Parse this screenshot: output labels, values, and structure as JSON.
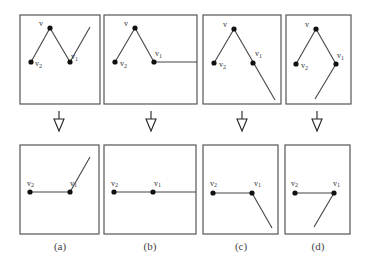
{
  "figure": {
    "panels": [
      {
        "id": "a",
        "caption": "(a)",
        "top": {
          "labels": {
            "v": "v",
            "v1": "v1",
            "v2": "v2"
          },
          "outgoing_edge": "up-right from v1"
        },
        "bottom": {
          "labels": {
            "v1": "v1",
            "v2": "v2"
          },
          "outgoing_edge": "up-right from v1"
        }
      },
      {
        "id": "b",
        "caption": "(b)",
        "top": {
          "labels": {
            "v": "v",
            "v1": "v1",
            "v2": "v2"
          },
          "outgoing_edge": "horizontal right from v1"
        },
        "bottom": {
          "labels": {
            "v1": "v1",
            "v2": "v2"
          },
          "outgoing_edge": "horizontal right from v1"
        }
      },
      {
        "id": "c",
        "caption": "(c)",
        "top": {
          "labels": {
            "v": "v",
            "v1": "v1",
            "v2": "v2"
          },
          "outgoing_edge": "down-right from v1 (collinear with v-v1)"
        },
        "bottom": {
          "labels": {
            "v1": "v1",
            "v2": "v2"
          },
          "outgoing_edge": "down-right from v1"
        }
      },
      {
        "id": "d",
        "caption": "(d)",
        "top": {
          "labels": {
            "v": "v",
            "v1": "v1",
            "v2": "v2"
          },
          "outgoing_edge": "down-left from v1"
        },
        "bottom": {
          "labels": {
            "v1": "v1",
            "v2": "v2"
          },
          "outgoing_edge": "down-left from v1"
        }
      }
    ],
    "arrow": "hollow down arrow"
  },
  "captions": {
    "a": "(a)",
    "b": "(b)",
    "c": "(c)",
    "d": "(d)"
  },
  "labels": {
    "v": "v",
    "v_base": "v",
    "sub1": "1",
    "sub2": "2"
  }
}
